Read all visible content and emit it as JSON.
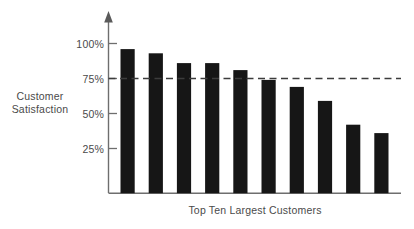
{
  "chart_data": {
    "type": "bar",
    "title": "",
    "subtitle": "",
    "xlabel": "Top Ten Largest Customers",
    "ylabel": "Customer Satisfaction",
    "categories": [
      "1",
      "2",
      "3",
      "4",
      "5",
      "6",
      "7",
      "8",
      "9",
      "10"
    ],
    "values": [
      96,
      93,
      86,
      86,
      81,
      74,
      69,
      59,
      42,
      36
    ],
    "ylim": [
      0,
      110
    ],
    "ytick_values": [
      25,
      50,
      75,
      100
    ],
    "ytick_labels": [
      "25%",
      "50%",
      "75%",
      "100%"
    ],
    "xtick_labels": [],
    "grid": false,
    "legend": null,
    "legend_position": "none",
    "annotations": [
      {
        "name": "target-reference-line",
        "kind": "horizontal-dashed-line",
        "value": 75,
        "label": ""
      }
    ],
    "series": [
      {
        "name": "Customer Satisfaction",
        "values": [
          96,
          93,
          86,
          86,
          81,
          74,
          69,
          59,
          42,
          36
        ],
        "color": "#161616"
      }
    ],
    "colors": {
      "bar": "#161616",
      "axis": "#6e6e6e",
      "reference_line": "#3c3c3c",
      "text": "#4a4a4a",
      "background": "#ffffff"
    },
    "axis_style": {
      "y_axis_arrow": true,
      "x_axis_arrow": false,
      "ticks_outside": true
    }
  },
  "labels": {
    "y_axis_title_line1": "Customer",
    "y_axis_title_line2": "Satisfaction",
    "x_axis_title": "Top Ten Largest Customers",
    "ytick_100": "100%",
    "ytick_75": "75%",
    "ytick_50": "50%",
    "ytick_25": "25%"
  }
}
